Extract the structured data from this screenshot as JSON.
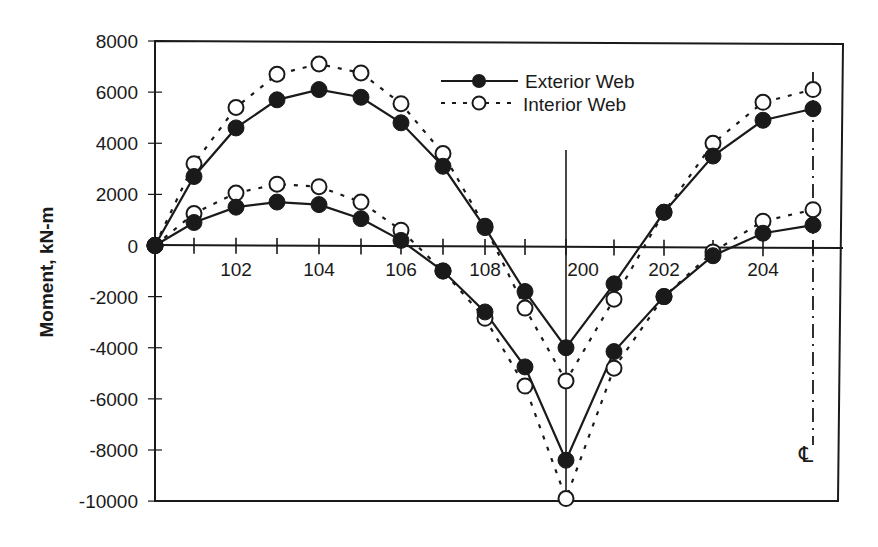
{
  "chart_data": {
    "type": "line",
    "title": "",
    "xlabel": "",
    "ylabel": "Moment, kN-m",
    "ylim": [
      -10000,
      8000
    ],
    "yticks": [
      8000,
      6000,
      4000,
      2000,
      0,
      -2000,
      -4000,
      -6000,
      -8000,
      -10000
    ],
    "ytick_labels": [
      "8000",
      "6000",
      "4000",
      "2000",
      "0",
      "-2000",
      "-4000",
      "-6000",
      "-8000",
      "-10000"
    ],
    "x": [
      "100",
      "101",
      "102",
      "103",
      "104",
      "105",
      "106",
      "107",
      "108",
      "109",
      "200",
      "201",
      "202",
      "203",
      "204",
      "205"
    ],
    "xtick_labels": [
      {
        "label": "102",
        "at": "102"
      },
      {
        "label": "104",
        "at": "104"
      },
      {
        "label": "106",
        "at": "106"
      },
      {
        "label": "108",
        "at": "108"
      },
      {
        "label": "200",
        "at": "200"
      },
      {
        "label": "202",
        "at": "202"
      },
      {
        "label": "204",
        "at": "204"
      }
    ],
    "grid": false,
    "legend_position": "upper center",
    "legend": [
      {
        "name": "Exterior Web",
        "style": "solid line, filled circle"
      },
      {
        "name": "Interior Web",
        "style": "dotted line, open circle"
      }
    ],
    "annotations": [
      {
        "text": "℄",
        "meaning": "centerline at node 205 (dash-dot vertical line)"
      },
      {
        "text": "",
        "meaning": "solid vertical line at node 200 (support)"
      }
    ],
    "series": [
      {
        "name": "Exterior Web",
        "curve": "positive envelope",
        "values": [
          0,
          2700,
          4600,
          5700,
          6100,
          5800,
          4800,
          3100,
          700,
          -1800,
          -4000,
          -1500,
          1300,
          3500,
          4900,
          5350
        ]
      },
      {
        "name": "Interior Web",
        "curve": "positive envelope",
        "values": [
          0,
          3200,
          5400,
          6700,
          7100,
          6750,
          5550,
          3600,
          750,
          -2450,
          -5300,
          -2100,
          1300,
          4000,
          5600,
          6100
        ]
      },
      {
        "name": "Exterior Web",
        "curve": "negative envelope",
        "values": [
          0,
          900,
          1500,
          1700,
          1600,
          1050,
          200,
          -1000,
          -2600,
          -4750,
          -8400,
          -4150,
          -2000,
          -400,
          480,
          800
        ]
      },
      {
        "name": "Interior Web",
        "curve": "negative envelope",
        "values": [
          0,
          1250,
          2050,
          2400,
          2300,
          1700,
          600,
          -1000,
          -2850,
          -5500,
          -9900,
          -4800,
          -2000,
          -250,
          950,
          1400
        ]
      }
    ]
  },
  "legend": {
    "exterior_label": "Exterior Web",
    "interior_label": "Interior Web"
  },
  "axis": {
    "ylabel": "Moment, kN-m",
    "centerline_label": "℄"
  }
}
